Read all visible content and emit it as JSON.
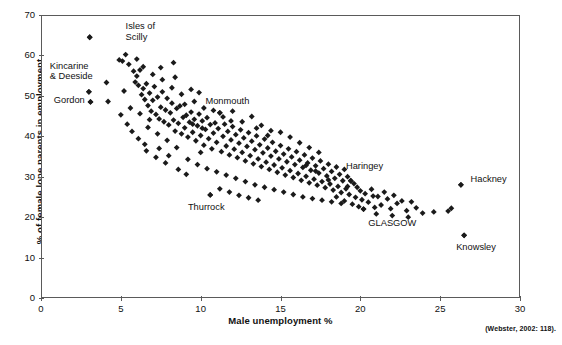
{
  "chart_data": {
    "type": "scatter",
    "title": "",
    "xlabel": "Male unemployment %",
    "ylabel": "% of female lone parents in employment",
    "xlim": [
      0,
      30
    ],
    "ylim": [
      0,
      70
    ],
    "xticks": [
      0,
      5,
      10,
      15,
      20,
      25,
      30
    ],
    "yticks": [
      0,
      10,
      20,
      30,
      40,
      50,
      60,
      70
    ],
    "grid": false,
    "legend": null,
    "marker": "diamond",
    "marker_color": "#1a1a1a",
    "source_note": "(Webster, 2002: 118).",
    "annotations": [
      {
        "label": "Isles of\nScilly",
        "x": 3.05,
        "y": 64.5,
        "label_x": 5.3,
        "label_y": 67.0
      },
      {
        "label": "Kincarine\n& Deeside",
        "x": 3.0,
        "y": 51.0,
        "label_x": 0.55,
        "label_y": 57.2
      },
      {
        "label": "Gordon",
        "x": 3.1,
        "y": 48.5,
        "label_x": 0.8,
        "label_y": 48.8
      },
      {
        "label": "Monmouth",
        "x": 11.2,
        "y": 45.8,
        "label_x": 10.3,
        "label_y": 48.4
      },
      {
        "label": "Thurrock",
        "x": 10.6,
        "y": 25.5,
        "label_x": 9.2,
        "label_y": 22.3
      },
      {
        "label": "Haringey",
        "x": 19.4,
        "y": 29.0,
        "label_x": 19.1,
        "label_y": 32.4
      },
      {
        "label": "GLASGOW",
        "x": 20.2,
        "y": 22.0,
        "label_x": 20.5,
        "label_y": 18.2
      },
      {
        "label": "Hackney",
        "x": 26.3,
        "y": 28.0,
        "label_x": 26.9,
        "label_y": 29.3
      },
      {
        "label": "Knowsley",
        "x": 26.5,
        "y": 15.5,
        "label_x": 26.0,
        "label_y": 12.4
      }
    ],
    "points": [
      [
        3.05,
        64.5
      ],
      [
        3.0,
        51.0
      ],
      [
        3.1,
        48.5
      ],
      [
        4.1,
        53.3
      ],
      [
        4.2,
        48.6
      ],
      [
        4.9,
        58.9
      ],
      [
        5.1,
        58.6
      ],
      [
        5.3,
        60.2
      ],
      [
        5.5,
        57.8
      ],
      [
        5.8,
        56.1
      ],
      [
        5.9,
        53.4
      ],
      [
        6.0,
        54.9
      ],
      [
        6.1,
        52.6
      ],
      [
        6.2,
        56.4
      ],
      [
        6.3,
        50.3
      ],
      [
        6.4,
        51.8
      ],
      [
        6.5,
        49.1
      ],
      [
        6.6,
        53.0
      ],
      [
        6.7,
        47.6
      ],
      [
        6.8,
        50.7
      ],
      [
        6.9,
        46.2
      ],
      [
        7.0,
        48.9
      ],
      [
        7.1,
        52.3
      ],
      [
        7.2,
        45.4
      ],
      [
        7.3,
        49.7
      ],
      [
        7.4,
        44.3
      ],
      [
        7.5,
        47.2
      ],
      [
        7.6,
        51.0
      ],
      [
        7.7,
        43.6
      ],
      [
        7.8,
        46.5
      ],
      [
        7.9,
        49.4
      ],
      [
        8.0,
        42.8
      ],
      [
        8.1,
        45.8
      ],
      [
        8.2,
        48.2
      ],
      [
        8.3,
        44.0
      ],
      [
        8.4,
        41.3
      ],
      [
        8.5,
        46.9
      ],
      [
        8.6,
        43.2
      ],
      [
        8.7,
        47.5
      ],
      [
        8.8,
        40.6
      ],
      [
        8.9,
        44.7
      ],
      [
        9.0,
        42.1
      ],
      [
        9.1,
        45.2
      ],
      [
        9.2,
        39.8
      ],
      [
        9.3,
        43.5
      ],
      [
        9.4,
        46.0
      ],
      [
        9.5,
        41.0
      ],
      [
        9.6,
        44.2
      ],
      [
        9.7,
        38.9
      ],
      [
        9.8,
        42.6
      ],
      [
        9.9,
        45.5
      ],
      [
        10.0,
        40.2
      ],
      [
        10.1,
        43.8
      ],
      [
        10.2,
        37.8
      ],
      [
        10.3,
        41.7
      ],
      [
        10.4,
        44.6
      ],
      [
        10.5,
        39.4
      ],
      [
        10.6,
        42.9
      ],
      [
        10.7,
        36.9
      ],
      [
        10.8,
        40.8
      ],
      [
        10.9,
        43.3
      ],
      [
        11.0,
        38.5
      ],
      [
        11.1,
        41.9
      ],
      [
        11.2,
        45.8
      ],
      [
        11.3,
        36.2
      ],
      [
        11.4,
        40.0
      ],
      [
        11.5,
        43.0
      ],
      [
        11.6,
        37.6
      ],
      [
        11.7,
        41.2
      ],
      [
        11.8,
        35.4
      ],
      [
        11.9,
        39.1
      ],
      [
        12.0,
        42.4
      ],
      [
        12.1,
        36.8
      ],
      [
        12.2,
        40.4
      ],
      [
        12.3,
        34.7
      ],
      [
        12.4,
        38.3
      ],
      [
        12.5,
        41.6
      ],
      [
        12.6,
        36.0
      ],
      [
        12.7,
        39.6
      ],
      [
        12.8,
        33.9
      ],
      [
        12.9,
        37.5
      ],
      [
        13.0,
        40.9
      ],
      [
        13.1,
        35.2
      ],
      [
        13.2,
        38.8
      ],
      [
        13.3,
        33.2
      ],
      [
        13.4,
        36.7
      ],
      [
        13.5,
        40.1
      ],
      [
        13.6,
        34.4
      ],
      [
        13.7,
        37.9
      ],
      [
        13.8,
        32.5
      ],
      [
        13.9,
        35.9
      ],
      [
        14.0,
        39.3
      ],
      [
        14.1,
        33.6
      ],
      [
        14.2,
        37.1
      ],
      [
        14.3,
        31.8
      ],
      [
        14.4,
        35.1
      ],
      [
        14.5,
        38.5
      ],
      [
        14.6,
        32.9
      ],
      [
        14.7,
        36.3
      ],
      [
        14.8,
        31.1
      ],
      [
        14.9,
        34.4
      ],
      [
        15.0,
        37.7
      ],
      [
        15.1,
        32.2
      ],
      [
        15.2,
        35.6
      ],
      [
        15.3,
        30.4
      ],
      [
        15.4,
        33.7
      ],
      [
        15.5,
        36.9
      ],
      [
        15.6,
        31.5
      ],
      [
        15.7,
        34.9
      ],
      [
        15.8,
        29.8
      ],
      [
        15.9,
        33.0
      ],
      [
        16.0,
        36.2
      ],
      [
        16.1,
        30.8
      ],
      [
        16.2,
        34.1
      ],
      [
        16.3,
        29.1
      ],
      [
        16.4,
        32.3
      ],
      [
        16.5,
        35.4
      ],
      [
        16.6,
        30.1
      ],
      [
        16.7,
        33.4
      ],
      [
        16.8,
        28.5
      ],
      [
        16.9,
        31.6
      ],
      [
        17.0,
        34.6
      ],
      [
        17.1,
        29.4
      ],
      [
        17.2,
        32.7
      ],
      [
        17.3,
        27.9
      ],
      [
        17.4,
        30.9
      ],
      [
        17.5,
        33.9
      ],
      [
        17.6,
        28.8
      ],
      [
        17.7,
        32.0
      ],
      [
        17.8,
        27.3
      ],
      [
        17.9,
        30.2
      ],
      [
        18.0,
        33.1
      ],
      [
        18.1,
        28.2
      ],
      [
        18.2,
        31.3
      ],
      [
        18.3,
        26.7
      ],
      [
        18.4,
        29.6
      ],
      [
        18.5,
        32.4
      ],
      [
        18.6,
        27.6
      ],
      [
        18.7,
        30.6
      ],
      [
        18.8,
        26.1
      ],
      [
        18.9,
        29.0
      ],
      [
        19.0,
        31.8
      ],
      [
        19.1,
        27.0
      ],
      [
        19.2,
        30.0
      ],
      [
        19.3,
        25.6
      ],
      [
        19.4,
        29.0
      ],
      [
        19.5,
        23.2
      ],
      [
        19.6,
        28.3
      ],
      [
        19.7,
        24.9
      ],
      [
        19.8,
        27.4
      ],
      [
        19.9,
        22.6
      ],
      [
        20.0,
        26.5
      ],
      [
        20.1,
        24.3
      ],
      [
        20.2,
        22.0
      ],
      [
        20.3,
        25.8
      ],
      [
        20.5,
        23.7
      ],
      [
        20.7,
        26.9
      ],
      [
        20.9,
        22.4
      ],
      [
        21.1,
        25.1
      ],
      [
        21.3,
        23.0
      ],
      [
        21.5,
        26.2
      ],
      [
        21.7,
        24.5
      ],
      [
        21.9,
        22.1
      ],
      [
        22.1,
        25.4
      ],
      [
        22.3,
        23.4
      ],
      [
        22.6,
        24.0
      ],
      [
        22.9,
        21.6
      ],
      [
        23.2,
        23.8
      ],
      [
        23.5,
        22.3
      ],
      [
        23.9,
        21.0
      ],
      [
        6.2,
        45.6
      ],
      [
        6.8,
        44.1
      ],
      [
        7.4,
        37.0
      ],
      [
        8.0,
        35.2
      ],
      [
        5.6,
        47.0
      ],
      [
        7.0,
        55.3
      ],
      [
        7.6,
        54.0
      ],
      [
        8.2,
        52.0
      ],
      [
        8.8,
        50.4
      ],
      [
        9.4,
        51.6
      ],
      [
        9.0,
        47.9
      ],
      [
        9.6,
        48.6
      ],
      [
        10.2,
        47.0
      ],
      [
        10.8,
        46.4
      ],
      [
        11.4,
        44.8
      ],
      [
        12.0,
        46.2
      ],
      [
        12.6,
        43.6
      ],
      [
        13.2,
        44.9
      ],
      [
        13.8,
        42.7
      ],
      [
        14.4,
        41.4
      ],
      [
        15.0,
        41.0
      ],
      [
        15.6,
        39.8
      ],
      [
        16.2,
        38.4
      ],
      [
        16.8,
        37.2
      ],
      [
        17.4,
        36.0
      ],
      [
        9.2,
        34.3
      ],
      [
        9.8,
        33.0
      ],
      [
        10.4,
        32.0
      ],
      [
        11.0,
        31.2
      ],
      [
        11.6,
        30.4
      ],
      [
        12.2,
        29.6
      ],
      [
        12.8,
        28.8
      ],
      [
        13.4,
        28.0
      ],
      [
        14.0,
        27.4
      ],
      [
        14.6,
        26.8
      ],
      [
        15.2,
        26.2
      ],
      [
        15.8,
        25.6
      ],
      [
        16.4,
        25.0
      ],
      [
        17.0,
        24.6
      ],
      [
        17.6,
        24.2
      ],
      [
        18.2,
        23.8
      ],
      [
        18.8,
        23.4
      ],
      [
        8.5,
        37.2
      ],
      [
        7.9,
        39.0
      ],
      [
        7.3,
        40.6
      ],
      [
        6.7,
        42.2
      ],
      [
        8.4,
        54.6
      ],
      [
        9.9,
        50.8
      ],
      [
        6.0,
        59.1
      ],
      [
        6.4,
        57.2
      ],
      [
        5.2,
        51.2
      ],
      [
        5.0,
        45.3
      ],
      [
        5.4,
        43.0
      ],
      [
        5.7,
        41.2
      ],
      [
        6.1,
        39.4
      ],
      [
        6.5,
        38.0
      ],
      [
        10.0,
        36.0
      ],
      [
        10.6,
        25.5
      ],
      [
        11.2,
        27.0
      ],
      [
        11.8,
        26.2
      ],
      [
        12.4,
        25.4
      ],
      [
        13.0,
        24.8
      ],
      [
        13.6,
        24.2
      ],
      [
        8.6,
        31.8
      ],
      [
        9.1,
        30.6
      ],
      [
        7.8,
        33.4
      ],
      [
        7.2,
        34.8
      ],
      [
        6.6,
        36.4
      ],
      [
        18.5,
        25.0
      ],
      [
        19.0,
        24.0
      ],
      [
        26.3,
        28.0
      ],
      [
        26.5,
        15.5
      ],
      [
        25.5,
        21.5
      ],
      [
        25.7,
        22.2
      ],
      [
        24.6,
        21.3
      ],
      [
        21.0,
        20.8
      ],
      [
        22.0,
        20.4
      ],
      [
        23.0,
        20.0
      ],
      [
        8.3,
        58.2
      ],
      [
        7.5,
        57.0
      ],
      [
        9.5,
        43.0
      ],
      [
        10.1,
        42.0
      ],
      [
        11.9,
        43.8
      ],
      [
        13.5,
        42.0
      ],
      [
        14.2,
        40.2
      ],
      [
        16.6,
        32.8
      ],
      [
        17.2,
        31.4
      ],
      [
        18.0,
        29.2
      ],
      [
        19.2,
        27.6
      ],
      [
        20.8,
        25.2
      ]
    ]
  }
}
